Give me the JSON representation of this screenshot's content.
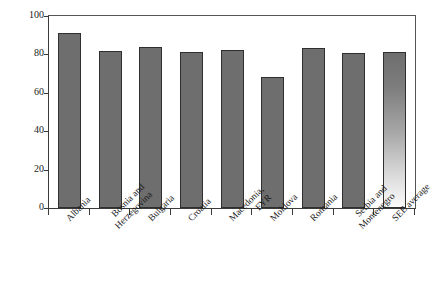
{
  "chart_data": {
    "type": "bar",
    "title": "",
    "xlabel": "",
    "ylabel": "% of total firms",
    "ylim": [
      0,
      100
    ],
    "yticks": [
      0,
      20,
      40,
      60,
      80,
      100
    ],
    "grid": false,
    "legend": "none",
    "bar_color": "#6e6e6e",
    "last_bar_style": "vertical-gradient-dark-to-white",
    "categories": [
      "Albania",
      "Bosnia and Herzegovina",
      "Bulgaria",
      "Croatia",
      "Macedonia, FYR",
      "Moldova",
      "Romania",
      "Serbia and Montenegro",
      "SEE average"
    ],
    "category_lines": [
      [
        "Albania"
      ],
      [
        "Bosnia and",
        "Herzegovina"
      ],
      [
        "Bulgaria"
      ],
      [
        "Croatia"
      ],
      [
        "Macedonia,",
        "FYR"
      ],
      [
        "Moldova"
      ],
      [
        "Romania"
      ],
      [
        "Serbia and",
        "Montenegro"
      ],
      [
        "SEE average"
      ]
    ],
    "values": [
      91,
      82,
      84,
      81,
      82.5,
      68,
      83.5,
      80.5,
      81.5
    ]
  }
}
